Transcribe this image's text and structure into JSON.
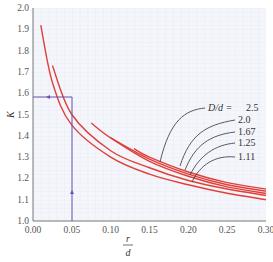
{
  "chart_data": {
    "type": "line",
    "title": "",
    "xlabel": "r/d",
    "xlabel_numerator": "r",
    "xlabel_denominator": "d",
    "ylabel": "K",
    "xlim": [
      0.0,
      0.3
    ],
    "ylim": [
      1.0,
      2.0
    ],
    "grid": true,
    "x_ticks": [
      "0.00",
      "0.05",
      "0.10",
      "0.15",
      "0.20",
      "0.25",
      "0.30"
    ],
    "y_ticks": [
      "1.0",
      "1.1",
      "1.2",
      "1.3",
      "1.4",
      "1.5",
      "1.6",
      "1.7",
      "1.8",
      "1.9",
      "2.0"
    ],
    "legend_title": "D/d = ",
    "series": [
      {
        "name": "D/d = 2.5",
        "label": "2.5",
        "x": [
          0.13,
          0.15,
          0.2,
          0.25,
          0.3
        ],
        "y": [
          1.34,
          1.3,
          1.23,
          1.18,
          1.15
        ]
      },
      {
        "name": "D/d = 2.0",
        "label": "2.0",
        "x": [
          0.1,
          0.15,
          0.2,
          0.25,
          0.3
        ],
        "y": [
          1.39,
          1.29,
          1.22,
          1.17,
          1.14
        ]
      },
      {
        "name": "D/d = 1.67",
        "label": "1.67",
        "x": [
          0.075,
          0.1,
          0.15,
          0.2,
          0.25,
          0.3
        ],
        "y": [
          1.46,
          1.39,
          1.28,
          1.21,
          1.16,
          1.13
        ]
      },
      {
        "name": "D/d = 1.25",
        "label": "1.25",
        "x": [
          0.025,
          0.05,
          0.1,
          0.15,
          0.2,
          0.25,
          0.3
        ],
        "y": [
          1.73,
          1.5,
          1.33,
          1.25,
          1.19,
          1.15,
          1.12
        ]
      },
      {
        "name": "D/d = 1.11",
        "label": "1.11",
        "x": [
          0.01,
          0.025,
          0.05,
          0.1,
          0.15,
          0.2,
          0.25,
          0.3
        ],
        "y": [
          1.92,
          1.65,
          1.45,
          1.3,
          1.22,
          1.17,
          1.13,
          1.1
        ]
      }
    ],
    "annotations": [
      {
        "type": "guide-line",
        "x": 0.05,
        "y": 1.58,
        "description": "Vertical line at r/d=0.05 up to curve, horizontal line to K≈1.58"
      }
    ]
  },
  "colors": {
    "curve": "#e0403a",
    "guide": "#6a4fb0",
    "grid": "#dde2ef",
    "background": "#f4f6fb"
  }
}
